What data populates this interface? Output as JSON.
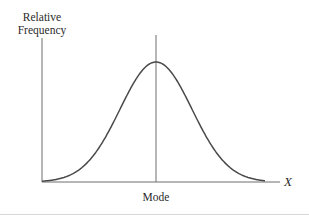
{
  "chart_data": {
    "type": "line",
    "title": "",
    "xlabel": "X",
    "ylabel": "Relative Frequency",
    "ylabel_lines": [
      "Relative",
      "Frequency"
    ],
    "annotations": [
      {
        "text": "Mode",
        "position": "x-axis below peak",
        "vertical_line_at": "mode"
      }
    ],
    "series": [
      {
        "name": "Symmetric bell-shaped distribution",
        "shape": "normal",
        "x": [
          0.0,
          0.1,
          0.2,
          0.3,
          0.4,
          0.5,
          0.6,
          0.7,
          0.8,
          0.9,
          1.0
        ],
        "values": [
          0.01,
          0.08,
          0.28,
          0.62,
          0.93,
          1.0,
          0.93,
          0.62,
          0.28,
          0.08,
          0.01
        ]
      }
    ],
    "xlim": [
      0,
      1
    ],
    "ylim": [
      0,
      1.2
    ],
    "grid": false,
    "legend": "none",
    "tick_labels": {
      "x": [
        "Mode"
      ],
      "y": []
    }
  },
  "labels": {
    "ylabel_line1": "Relative",
    "ylabel_line2": "Frequency",
    "xlabel": "X",
    "mode": "Mode"
  },
  "colors": {
    "axis": "#6e6e6e",
    "curve": "#4a4a4a",
    "text": "#2a2a2a",
    "bottom_rule": "#d8d8d8"
  }
}
